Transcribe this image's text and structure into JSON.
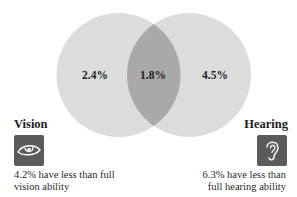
{
  "diagram": {
    "type": "venn",
    "colors": {
      "circle_fill": "#dcdcdc",
      "overlap_fill": "#a9a9a9",
      "icon_box": "#5b5b5b",
      "icon_stroke": "#ffffff"
    },
    "regions": {
      "vision_only": "2.4%",
      "both": "1.8%",
      "hearing_only": "4.5%"
    },
    "sets": [
      {
        "title": "Vision",
        "icon": "eye-icon",
        "description_line1": "4.2% have less than full",
        "description_line2": "vision ability"
      },
      {
        "title": "Hearing",
        "icon": "ear-icon",
        "description_line1": "6.3% have less than",
        "description_line2": "full hearing ability"
      }
    ]
  }
}
